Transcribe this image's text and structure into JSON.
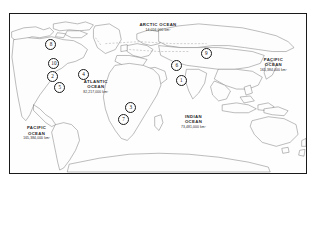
{
  "figure": {
    "kind": "world-map",
    "frame_color": "#1a1a1a",
    "land_outline_color": "#555555",
    "background_color": "#ffffff"
  },
  "ocean_labels": [
    {
      "id": "arctic",
      "name": "ARCTIC OCEAN",
      "area": "14,056,000 km²",
      "x": 50,
      "y": 7
    },
    {
      "id": "atlantic",
      "name": "ATLANTIC",
      "name2": "OCEAN",
      "area": "82,217,000 km²",
      "x": 29,
      "y": 43
    },
    {
      "id": "indian",
      "name": "INDIAN",
      "name2": "OCEAN",
      "area": "73,481,000 km²",
      "x": 62,
      "y": 65
    },
    {
      "id": "pacific-west",
      "name": "PACIFIC",
      "name2": "OCEAN",
      "area": "165,384,000 km²",
      "x": 7,
      "y": 72
    },
    {
      "id": "pacific-east",
      "name": "PACIFIC",
      "name2": "OCEAN",
      "area": "165,384,000 km²",
      "x": 88,
      "y": 29
    }
  ],
  "markers": [
    {
      "label": "8",
      "x": 13.5,
      "y": 18.5,
      "region": "north-america"
    },
    {
      "label": "10",
      "x": 14.5,
      "y": 30.5,
      "region": "north-america"
    },
    {
      "label": "2",
      "x": 14.0,
      "y": 38.5,
      "region": "north-america"
    },
    {
      "label": "4",
      "x": 24.5,
      "y": 37.5,
      "region": "north-america"
    },
    {
      "label": "5",
      "x": 16.5,
      "y": 45.5,
      "region": "north-america"
    },
    {
      "label": "6",
      "x": 56.0,
      "y": 31.5,
      "region": "asia"
    },
    {
      "label": "9",
      "x": 66.0,
      "y": 24.5,
      "region": "asia"
    },
    {
      "label": "1",
      "x": 57.5,
      "y": 41.0,
      "region": "asia"
    },
    {
      "label": "3",
      "x": 40.5,
      "y": 58.0,
      "region": "africa"
    },
    {
      "label": "7",
      "x": 38.0,
      "y": 66.0,
      "region": "africa"
    }
  ]
}
